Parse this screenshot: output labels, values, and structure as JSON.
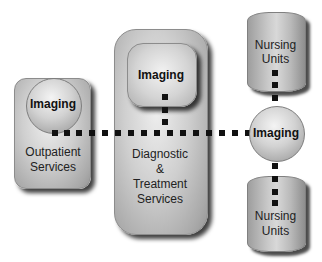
{
  "diagram": {
    "outpatient": {
      "imaging_label": "Imaging",
      "label_line1": "Outpatient",
      "label_line2": "Services"
    },
    "diagnostic": {
      "imaging_label": "Imaging",
      "label_line1": "Diagnostic",
      "label_line2": "&",
      "label_line3": "Treatment",
      "label_line4": "Services"
    },
    "central_imaging": {
      "label": "Imaging"
    },
    "nursing_top": {
      "label_line1": "Nursing",
      "label_line2": "Units"
    },
    "nursing_bottom": {
      "label_line1": "Nursing",
      "label_line2": "Units"
    },
    "colors": {
      "connector": "#111111",
      "shape_fill": "#c8c8c8",
      "shadow": "#333333"
    }
  }
}
